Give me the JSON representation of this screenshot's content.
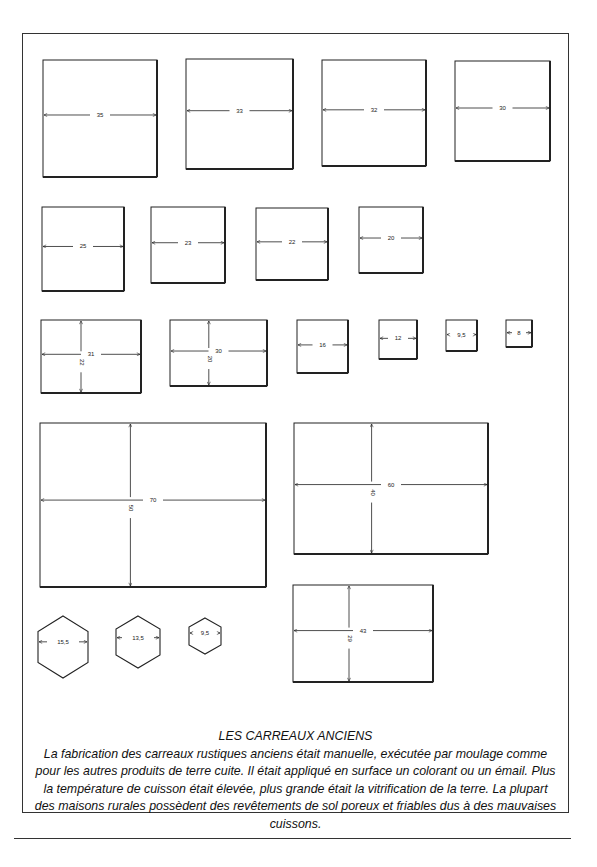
{
  "document": {
    "title": "LES CARREAUX ANCIENS",
    "body": "La fabrication des carreaux rustiques anciens était manuelle, exécutée par moulage comme pour les autres produits de terre cuite. Il était appliqué en surface un colorant ou un émail. Plus la température de cuisson était élevée, plus grande était la vitrification de la terre. La plupart des maisons rurales possèdent des revêtements de sol poreux et friables dus à des mauvaises cuissons."
  },
  "diagram": {
    "rows": [
      {
        "shape": "square",
        "tiles": [
          {
            "id": "sq-35",
            "width_label": "35",
            "x": 43,
            "y": 60,
            "w": 114,
            "h": 117
          },
          {
            "id": "sq-33",
            "width_label": "33",
            "x": 186,
            "y": 59,
            "w": 107,
            "h": 110
          },
          {
            "id": "sq-32",
            "width_label": "32",
            "x": 322,
            "y": 60,
            "w": 104,
            "h": 106
          },
          {
            "id": "sq-30",
            "width_label": "30",
            "x": 455,
            "y": 61,
            "w": 95,
            "h": 100
          }
        ]
      },
      {
        "shape": "square",
        "tiles": [
          {
            "id": "sq-25",
            "width_label": "25",
            "x": 42,
            "y": 207,
            "w": 82,
            "h": 84
          },
          {
            "id": "sq-23",
            "width_label": "23",
            "x": 151,
            "y": 207,
            "w": 74,
            "h": 76
          },
          {
            "id": "sq-22",
            "width_label": "22",
            "x": 256,
            "y": 208,
            "w": 72,
            "h": 72
          },
          {
            "id": "sq-20",
            "width_label": "20",
            "x": 359,
            "y": 207,
            "w": 64,
            "h": 66
          }
        ]
      },
      {
        "shape": "rect-and-small-squares",
        "tiles": [
          {
            "id": "rect-31x22",
            "width_label": "31",
            "height_label": "22",
            "x": 41,
            "y": 320,
            "w": 100,
            "h": 73
          },
          {
            "id": "rect-30x20",
            "width_label": "30",
            "height_label": "20",
            "x": 170,
            "y": 320,
            "w": 97,
            "h": 66
          },
          {
            "id": "sq-16",
            "width_label": "16",
            "x": 297,
            "y": 320,
            "w": 51,
            "h": 53
          },
          {
            "id": "sq-12",
            "width_label": "12",
            "x": 379,
            "y": 320,
            "w": 38,
            "h": 39
          },
          {
            "id": "sq-9-5",
            "width_label": "9,5",
            "x": 446,
            "y": 320,
            "w": 31,
            "h": 31
          },
          {
            "id": "sq-8",
            "width_label": "8",
            "x": 506,
            "y": 320,
            "w": 26,
            "h": 27
          }
        ]
      },
      {
        "shape": "rectangle",
        "tiles": [
          {
            "id": "rect-70x50",
            "width_label": "70",
            "height_label": "50",
            "x": 40,
            "y": 423,
            "w": 226,
            "h": 164
          },
          {
            "id": "rect-60x40",
            "width_label": "60",
            "height_label": "40",
            "x": 294,
            "y": 423,
            "w": 194,
            "h": 131
          }
        ]
      },
      {
        "shape": "hexagon-and-rect",
        "tiles": [
          {
            "id": "hex-15-5",
            "width_label": "15,5",
            "cx": 63,
            "cy": 647,
            "w": 50,
            "h": 62
          },
          {
            "id": "hex-13-5",
            "width_label": "13,5",
            "cx": 138,
            "cy": 642,
            "w": 44,
            "h": 52
          },
          {
            "id": "hex-9-5",
            "width_label": "9,5",
            "cx": 205,
            "cy": 636,
            "w": 32,
            "h": 36
          },
          {
            "id": "rect-43x29",
            "width_label": "43",
            "height_label": "29",
            "x": 293,
            "y": 585,
            "w": 140,
            "h": 97
          }
        ]
      }
    ]
  },
  "colors": {
    "ink": "#222222",
    "paper": "#ffffff"
  }
}
